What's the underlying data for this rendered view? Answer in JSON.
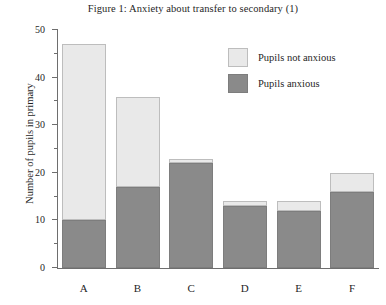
{
  "chart_data": {
    "type": "bar",
    "title": "Figure 1: Anxiety about transfer to secondary (1)",
    "xlabel": "",
    "ylabel": "Number of pupils in primary",
    "categories": [
      "A",
      "B",
      "C",
      "D",
      "E",
      "F"
    ],
    "ylim": [
      0,
      50
    ],
    "ytick_labels": [
      "0",
      "10",
      "20",
      "30",
      "40",
      "50"
    ],
    "ytick_values": [
      0,
      10,
      20,
      30,
      40,
      50
    ],
    "yminor_values": [
      5,
      15,
      25,
      35,
      45
    ],
    "grid": false,
    "stacked": true,
    "legend_position": "upper right",
    "series": [
      {
        "name": "Pupils anxious",
        "color": "#8a8a8a",
        "values": [
          10,
          17,
          22,
          13,
          12,
          16
        ]
      },
      {
        "name": "Pupils not anxious",
        "color": "#e9e9e9",
        "values": [
          37,
          19,
          1,
          1,
          2,
          4
        ]
      }
    ],
    "totals": [
      47,
      36,
      23,
      14,
      14,
      20
    ]
  },
  "legend": {
    "items": [
      {
        "label": "Pupils not anxious",
        "key": "not-anxious"
      },
      {
        "label": "Pupils anxious",
        "key": "anxious"
      }
    ]
  }
}
